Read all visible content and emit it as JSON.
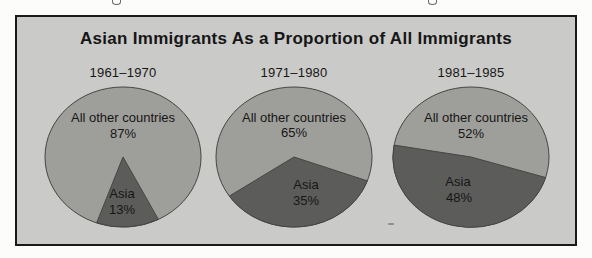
{
  "figure": {
    "title": "Asian Immigrants As a Proportion of All Immigrants"
  },
  "colors": {
    "page_background": "#fcfcfa",
    "frame_background": "#cacac8",
    "frame_border": "#1a1a1a",
    "others_slice": "#9e9e9a",
    "asia_slice": "#5c5c5a",
    "pie_outline": "#454543",
    "text": "#161616"
  },
  "chart_data": [
    {
      "type": "pie",
      "title": "1961–1970",
      "slices": [
        {
          "label": "All other countries",
          "value": 87,
          "color": "#9e9e9a"
        },
        {
          "label": "Asia",
          "value": 13,
          "color": "#5c5c5a"
        }
      ]
    },
    {
      "type": "pie",
      "title": "1971–1980",
      "slices": [
        {
          "label": "All other countries",
          "value": 65,
          "color": "#9e9e9a"
        },
        {
          "label": "Asia",
          "value": 35,
          "color": "#5c5c5a"
        }
      ]
    },
    {
      "type": "pie",
      "title": "1981–1985",
      "slices": [
        {
          "label": "All other countries",
          "value": 52,
          "color": "#9e9e9a"
        },
        {
          "label": "Asia",
          "value": 48,
          "color": "#5c5c5a"
        }
      ]
    }
  ]
}
